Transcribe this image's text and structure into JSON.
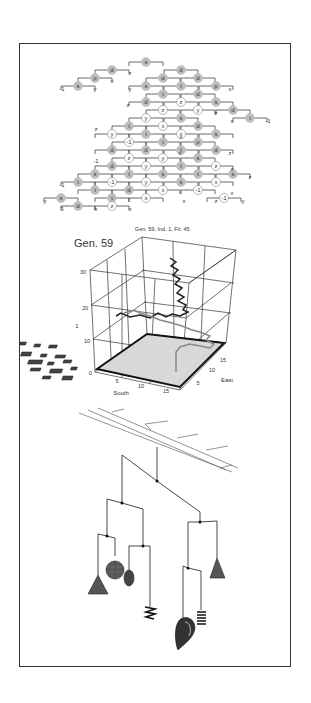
{
  "figure": {
    "panel_tree": {
      "description": "Genetic program tree (diagonal layout)",
      "rows": [
        {
          "y": 62,
          "nodes": [
            {
              "x": 146,
              "t": "s",
              "f": "g"
            }
          ]
        },
        {
          "y": 70,
          "nodes": [
            {
              "x": 112,
              "t": "d",
              "f": "g"
            },
            {
              "x": 181,
              "t": "d",
              "f": "g"
            }
          ]
        },
        {
          "y": 78,
          "nodes": [
            {
              "x": 95,
              "t": "p",
              "f": "g"
            },
            {
              "x": 163,
              "t": "d",
              "f": "g"
            },
            {
              "x": 198,
              "t": "d",
              "f": "g"
            }
          ]
        },
        {
          "y": 86,
          "nodes": [
            {
              "x": 78,
              "t": "s",
              "f": "g"
            },
            {
              "x": 146,
              "t": "s",
              "f": "g"
            },
            {
              "x": 181,
              "t": "t",
              "f": "g"
            },
            {
              "x": 216,
              "t": "p",
              "f": "g"
            }
          ]
        },
        {
          "y": 94,
          "nodes": [
            {
              "x": 163,
              "t": "t",
              "f": "g"
            },
            {
              "x": 198,
              "t": "d",
              "f": "g"
            }
          ]
        },
        {
          "y": 102,
          "nodes": [
            {
              "x": 146,
              "t": "d",
              "f": "g"
            },
            {
              "x": 181,
              "t": "z",
              "f": "w"
            },
            {
              "x": 216,
              "t": "s",
              "f": "g"
            }
          ]
        },
        {
          "y": 110,
          "nodes": [
            {
              "x": 163,
              "t": "z",
              "f": "w"
            },
            {
              "x": 198,
              "t": "y",
              "f": "w"
            },
            {
              "x": 233,
              "t": "d",
              "f": "g"
            }
          ]
        },
        {
          "y": 118,
          "nodes": [
            {
              "x": 146,
              "t": "y",
              "f": "w"
            },
            {
              "x": 181,
              "t": "s",
              "f": "g"
            },
            {
              "x": 250,
              "t": "t",
              "f": "g"
            }
          ]
        },
        {
          "y": 126,
          "nodes": [
            {
              "x": 129,
              "t": "t",
              "f": "g"
            },
            {
              "x": 163,
              "t": "x",
              "f": "w"
            },
            {
              "x": 198,
              "t": "d",
              "f": "g"
            }
          ]
        },
        {
          "y": 134,
          "nodes": [
            {
              "x": 112,
              "t": "y",
              "f": "w"
            },
            {
              "x": 146,
              "t": "t",
              "f": "g"
            },
            {
              "x": 181,
              "t": "x",
              "f": "w"
            },
            {
              "x": 216,
              "t": "s",
              "f": "g"
            }
          ]
        },
        {
          "y": 142,
          "nodes": [
            {
              "x": 129,
              "t": "-1",
              "f": "w"
            },
            {
              "x": 163,
              "t": "t",
              "f": "g"
            },
            {
              "x": 198,
              "t": "p",
              "f": "g"
            }
          ]
        },
        {
          "y": 150,
          "nodes": [
            {
              "x": 112,
              "t": "d",
              "f": "g"
            },
            {
              "x": 146,
              "t": "d",
              "f": "g"
            },
            {
              "x": 181,
              "t": "t",
              "f": "g"
            },
            {
              "x": 216,
              "t": "d",
              "f": "g"
            }
          ]
        },
        {
          "y": 158,
          "nodes": [
            {
              "x": 129,
              "t": "z",
              "f": "w"
            },
            {
              "x": 163,
              "t": "y",
              "f": "w"
            },
            {
              "x": 198,
              "t": "s",
              "f": "g"
            }
          ]
        },
        {
          "y": 166,
          "nodes": [
            {
              "x": 112,
              "t": "d",
              "f": "g"
            },
            {
              "x": 146,
              "t": "y",
              "f": "w"
            },
            {
              "x": 181,
              "t": "t",
              "f": "g"
            },
            {
              "x": 216,
              "t": "z",
              "f": "w"
            }
          ]
        },
        {
          "y": 174,
          "nodes": [
            {
              "x": 95,
              "t": "s",
              "f": "g"
            },
            {
              "x": 129,
              "t": "t",
              "f": "g"
            },
            {
              "x": 163,
              "t": "s",
              "f": "g"
            },
            {
              "x": 198,
              "t": "t",
              "f": "g"
            },
            {
              "x": 233,
              "t": "s",
              "f": "g"
            }
          ]
        },
        {
          "y": 182,
          "nodes": [
            {
              "x": 78,
              "t": "t",
              "f": "g"
            },
            {
              "x": 112,
              "t": "-1",
              "f": "w"
            },
            {
              "x": 146,
              "t": "y",
              "f": "w"
            },
            {
              "x": 181,
              "t": "s",
              "f": "g"
            },
            {
              "x": 216,
              "t": "x",
              "f": "w"
            }
          ]
        },
        {
          "y": 190,
          "nodes": [
            {
              "x": 95,
              "t": "t",
              "f": "g"
            },
            {
              "x": 129,
              "t": "d",
              "f": "g"
            },
            {
              "x": 163,
              "t": "x",
              "f": "w"
            },
            {
              "x": 198,
              "t": "-1",
              "f": "w"
            }
          ]
        },
        {
          "y": 198,
          "nodes": [
            {
              "x": 61,
              "t": "s",
              "f": "g"
            },
            {
              "x": 112,
              "t": "t",
              "f": "g"
            },
            {
              "x": 146,
              "t": "x",
              "f": "w"
            },
            {
              "x": 224,
              "t": "-1",
              "f": "w"
            }
          ]
        },
        {
          "y": 206,
          "nodes": [
            {
              "x": 78,
              "t": "d",
              "f": "g"
            },
            {
              "x": 112,
              "t": "z",
              "f": "w"
            }
          ]
        }
      ],
      "leaves": [
        {
          "x": 62,
          "y": 91,
          "t": "-1"
        },
        {
          "x": 95,
          "y": 91,
          "t": "y"
        },
        {
          "x": 112,
          "y": 83,
          "t": "x"
        },
        {
          "x": 130,
          "y": 75,
          "t": "z"
        },
        {
          "x": 130,
          "y": 91,
          "t": "y"
        },
        {
          "x": 230,
          "y": 91,
          "t": "x"
        },
        {
          "x": 128,
          "y": 107,
          "t": "z"
        },
        {
          "x": 216,
          "y": 115,
          "t": "z"
        },
        {
          "x": 232,
          "y": 123,
          "t": "x"
        },
        {
          "x": 268,
          "y": 123,
          "t": "-1"
        },
        {
          "x": 96,
          "y": 131,
          "t": "z"
        },
        {
          "x": 181,
          "y": 139,
          "t": "x"
        },
        {
          "x": 180,
          "y": 155,
          "t": "x"
        },
        {
          "x": 230,
          "y": 155,
          "t": "z"
        },
        {
          "x": 96,
          "y": 163,
          "t": "-1"
        },
        {
          "x": 232,
          "y": 171,
          "t": "z"
        },
        {
          "x": 62,
          "y": 187,
          "t": "-1"
        },
        {
          "x": 250,
          "y": 179,
          "t": "z"
        },
        {
          "x": 232,
          "y": 195,
          "t": "x"
        },
        {
          "x": 184,
          "y": 203,
          "t": "x"
        },
        {
          "x": 216,
          "y": 203,
          "t": "z"
        },
        {
          "x": 243,
          "y": 203,
          "t": "y"
        },
        {
          "x": 45,
          "y": 203,
          "t": "y"
        },
        {
          "x": 62,
          "y": 211,
          "t": "3"
        },
        {
          "x": 96,
          "y": 211,
          "t": "x"
        },
        {
          "x": 130,
          "y": 211,
          "t": "x"
        }
      ]
    },
    "panel_plot3d": {
      "caption": "Gen. 59, Ind. 1, Fit. 45.",
      "gen_label": "Gen. 59",
      "z_axis_label": "1",
      "z_ticks": [
        "0",
        "10",
        "20",
        "30"
      ],
      "south_label": "South",
      "east_label": "East",
      "south_ticks": [
        "5",
        "10",
        "15"
      ],
      "east_ticks": [
        "5",
        "10",
        "15"
      ]
    },
    "panel_mobile": {
      "description": "3D mobile sculpture with hanging cones, spheres and springs"
    }
  },
  "chart_data": {
    "type": "line",
    "title": "Gen. 59, Ind. 1, Fit. 45.",
    "xlabel": "South",
    "ylabel": "East",
    "zlabel": "1",
    "xlim": [
      0,
      18
    ],
    "ylim": [
      0,
      18
    ],
    "zlim": [
      0,
      35
    ],
    "x_ticks": [
      5,
      10,
      15
    ],
    "y_ticks": [
      5,
      10,
      15
    ],
    "z_ticks": [
      0,
      10,
      20,
      30
    ],
    "series": [
      {
        "name": "trajectory (dark)",
        "color": "#222222"
      },
      {
        "name": "trajectory (grey)",
        "color": "#888888"
      }
    ]
  }
}
